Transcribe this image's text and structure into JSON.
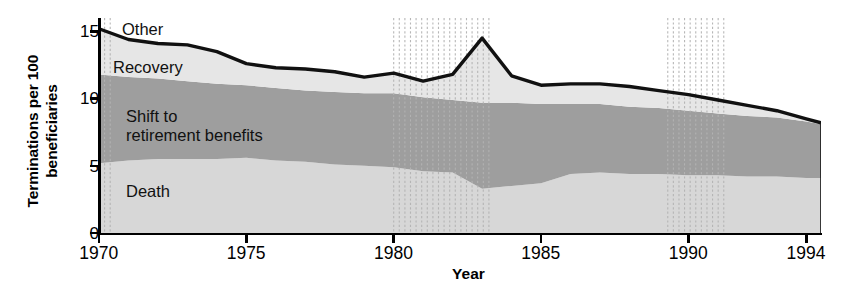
{
  "chart_data": {
    "type": "area",
    "title": "",
    "xlabel": "Year",
    "ylabel": "Terminations per 100\nbeneficiaries",
    "xlim": [
      1970,
      1994.5
    ],
    "ylim": [
      0,
      16
    ],
    "xticks": [
      1970,
      1975,
      1980,
      1985,
      1990,
      1994
    ],
    "xticklabels": [
      "1970",
      "1975",
      "1980",
      "1985",
      "1990",
      "1994"
    ],
    "yticks": [
      0,
      5,
      10,
      15
    ],
    "yticklabels": [
      "0",
      "5",
      "10",
      "15"
    ],
    "grid": false,
    "legend_position": "in-plot annotations",
    "stacked": true,
    "x": [
      1970,
      1971,
      1972,
      1973,
      1974,
      1975,
      1976,
      1977,
      1978,
      1979,
      1980,
      1981,
      1982,
      1983,
      1984,
      1985,
      1986,
      1987,
      1988,
      1989,
      1990,
      1991,
      1992,
      1993,
      1994,
      1994.5
    ],
    "series": [
      {
        "name": "Death",
        "color": "#d7d7d7",
        "values": [
          5.2,
          5.4,
          5.5,
          5.5,
          5.5,
          5.6,
          5.4,
          5.3,
          5.1,
          5.0,
          4.9,
          4.6,
          4.5,
          3.3,
          3.5,
          3.7,
          4.4,
          4.5,
          4.4,
          4.4,
          4.3,
          4.3,
          4.2,
          4.2,
          4.1,
          4.1
        ]
      },
      {
        "name": "Shift to retirement benefits",
        "color": "#9e9e9e",
        "values": [
          6.6,
          6.2,
          6.0,
          5.8,
          5.6,
          5.4,
          5.4,
          5.3,
          5.4,
          5.4,
          5.5,
          5.5,
          5.4,
          6.4,
          6.2,
          5.9,
          5.2,
          5.1,
          5.0,
          4.9,
          4.8,
          4.6,
          4.5,
          4.4,
          4.2,
          4.0
        ]
      },
      {
        "name": "Recovery",
        "color": "#e6e6e6",
        "values": [
          3.4,
          2.8,
          2.6,
          2.7,
          2.4,
          1.6,
          1.5,
          1.6,
          1.5,
          1.2,
          1.5,
          1.2,
          1.9,
          4.8,
          2.0,
          1.4,
          1.5,
          1.5,
          1.5,
          1.3,
          1.2,
          1.0,
          0.8,
          0.5,
          0.2,
          0.1
        ]
      },
      {
        "name": "Other",
        "color": "#ffffff",
        "values": [
          0,
          0,
          0,
          0,
          0,
          0,
          0,
          0,
          0,
          0,
          0,
          0,
          0,
          0,
          0,
          0,
          0,
          0,
          0,
          0,
          0,
          0,
          0,
          0,
          0,
          0
        ]
      }
    ],
    "totals": [
      15.2,
      14.4,
      14.1,
      14.0,
      13.5,
      12.6,
      12.3,
      12.2,
      12.0,
      11.6,
      11.9,
      11.3,
      11.8,
      14.5,
      11.7,
      11.0,
      11.1,
      11.1,
      10.9,
      10.6,
      10.3,
      9.9,
      9.5,
      9.1,
      8.5,
      8.2
    ],
    "recession_bands": [
      {
        "start": 1970.0,
        "end": 1970.55
      },
      {
        "start": 1980.0,
        "end": 1983.25
      },
      {
        "start": 1989.3,
        "end": 1991.25
      }
    ],
    "annotations": [
      {
        "text": "Other",
        "x_px": 122,
        "y_px": 20
      },
      {
        "text": "Recovery",
        "x_px": 113,
        "y_px": 58
      },
      {
        "text": "Shift to\nretirement benefits",
        "x_px": 126,
        "y_px": 107
      },
      {
        "text": "Death",
        "x_px": 126,
        "y_px": 182
      }
    ]
  },
  "axis": {
    "x_title": "Year",
    "y_title": "Terminations per 100\nbeneficiaries"
  },
  "colors": {
    "death": "#d7d7d7",
    "shift": "#9e9e9e",
    "recovery": "#e6e6e6",
    "other": "#ffffff",
    "outline": "#111111",
    "band": "#b4b4b4",
    "axis": "#000000"
  }
}
